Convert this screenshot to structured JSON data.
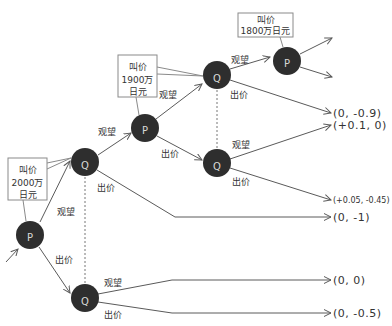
{
  "diagram": {
    "type": "game-tree",
    "players": {
      "first": "P",
      "second": "Q"
    },
    "colors": {
      "node_fill": "#2e2e2e",
      "node_text": "#d8d8d8",
      "edge": "#5a5a5a",
      "callout_border": "#8a8a8a"
    },
    "nodes": [
      {
        "id": "P1",
        "label": "P"
      },
      {
        "id": "Q1",
        "label": "Q"
      },
      {
        "id": "Q2",
        "label": "Q"
      },
      {
        "id": "P2",
        "label": "P"
      },
      {
        "id": "Q3",
        "label": "Q"
      },
      {
        "id": "Q4",
        "label": "Q"
      },
      {
        "id": "P3",
        "label": "P"
      }
    ],
    "callouts": [
      {
        "node": "P1",
        "lines": [
          "叫价",
          "2000万",
          "日元"
        ]
      },
      {
        "node": "P2",
        "lines": [
          "叫价",
          "1900万",
          "日元"
        ]
      },
      {
        "node": "P3",
        "lines": [
          "叫价",
          "1800万日元"
        ]
      }
    ],
    "edges": [
      {
        "from": "P1",
        "to": "Q1",
        "label": "观望"
      },
      {
        "from": "P1",
        "to": "Q2",
        "label": "出价"
      },
      {
        "from": "Q1",
        "to": "P2",
        "label": "观望"
      },
      {
        "from": "Q1",
        "to": "payoff-4",
        "label": "出价"
      },
      {
        "from": "P2",
        "to": "Q3",
        "label": "观望"
      },
      {
        "from": "P2",
        "to": "Q4",
        "label": "出价"
      },
      {
        "from": "Q3",
        "to": "P3",
        "label": "观望"
      },
      {
        "from": "Q3",
        "to": "payoff-1",
        "label": "出价"
      },
      {
        "from": "Q4",
        "to": "payoff-2",
        "label": "观望"
      },
      {
        "from": "Q4",
        "to": "payoff-3",
        "label": "出价"
      },
      {
        "from": "Q2",
        "to": "payoff-5",
        "label": "观望"
      },
      {
        "from": "Q2",
        "to": "payoff-6",
        "label": "出价"
      }
    ],
    "payoffs": [
      "(0, -0.9)",
      "(+0.1, 0)",
      "(+0.05, -0.45)",
      "(0, -1)",
      "(0, 0)",
      "(0, -0.5)"
    ]
  }
}
